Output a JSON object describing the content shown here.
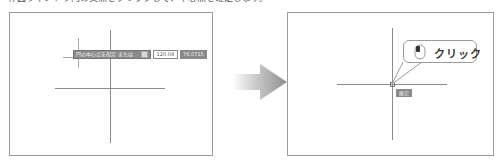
{
  "header": {
    "text": "作図ウィンドウ内の交点をクリックして、中心点を確定します。"
  },
  "left_panel": {
    "prompt": "円の中心点を指定 または",
    "value_1": "120.04",
    "value_2": "76.0715"
  },
  "right_panel": {
    "callout_label": "クリック",
    "confirm_label": "確定"
  },
  "icons": {
    "arrow": "right-arrow-icon",
    "mouse": "mouse-left-click-icon"
  },
  "colors": {
    "panel_border": "#9a9a9a",
    "line": "#8c8c8c",
    "prompt_bg": "#8a8a8a",
    "arrow": "#8f8f8f"
  }
}
